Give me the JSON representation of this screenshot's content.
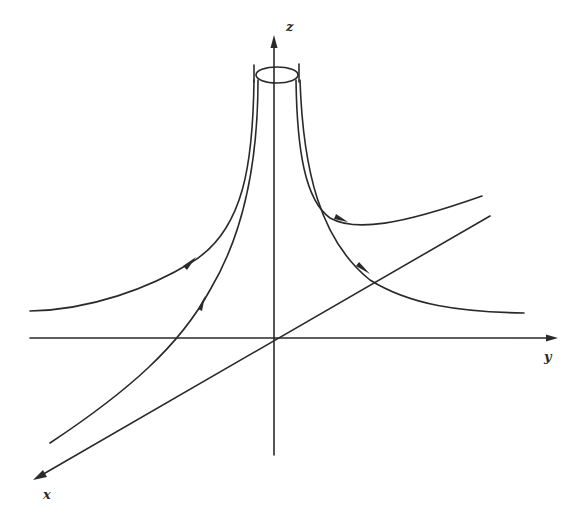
{
  "figure": {
    "axes": {
      "z": {
        "label": "z"
      },
      "y": {
        "label": "y"
      },
      "x": {
        "label": "x"
      }
    },
    "elements": {
      "tube": {
        "shape": "cylinder-top-ellipse",
        "around_axis": "z"
      },
      "trajectories": [
        {
          "name": "left-outer",
          "direction": "toward-tube",
          "arrow_count": 1
        },
        {
          "name": "left-inner",
          "direction": "toward-tube",
          "arrow_count": 1
        },
        {
          "name": "right-upper",
          "direction": "toward-tube",
          "arrow_count": 1
        },
        {
          "name": "right-lower",
          "direction": "toward-tube",
          "arrow_count": 1
        }
      ]
    },
    "colors": {
      "ink": "#2a2a2a",
      "background": "#ffffff"
    }
  }
}
